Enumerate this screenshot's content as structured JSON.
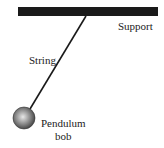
{
  "diagram": {
    "labels": {
      "support": "Support",
      "string": "String",
      "bob_line1": "Pendulum",
      "bob_line2": "bob"
    },
    "colors": {
      "support": "#1a1a1a",
      "string": "#1a1a1a",
      "bob_light": "#e0e0e0",
      "bob_dark": "#444444",
      "text": "#222222"
    }
  }
}
